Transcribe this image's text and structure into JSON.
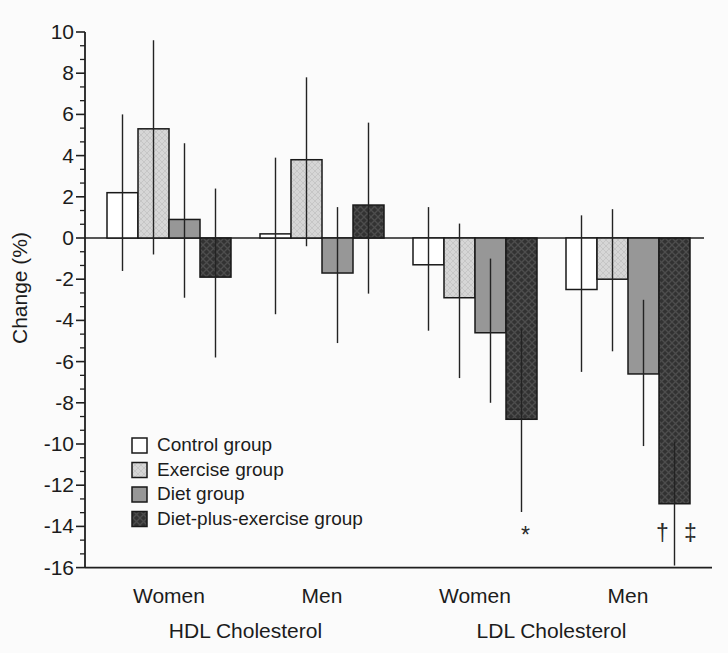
{
  "figure": {
    "background": "#fbfbfb",
    "text_color": "#1c1c1c",
    "axis_color": "#1f1f1f"
  },
  "chart_data": {
    "type": "bar",
    "title": "",
    "xlabel": "",
    "ylabel": "Change (%)",
    "ylim": [
      -16,
      10
    ],
    "ytick_interval": 2,
    "yticks": [
      10,
      8,
      6,
      4,
      2,
      0,
      -2,
      -4,
      -6,
      -8,
      -10,
      -12,
      -14,
      -16
    ],
    "grid": false,
    "legend_position": "lower-left",
    "categories": [
      "Women",
      "Men",
      "Women",
      "Men"
    ],
    "axis_groups": [
      {
        "label": "HDL Cholesterol",
        "category_indexes": [
          0,
          1
        ]
      },
      {
        "label": "LDL Cholesterol",
        "category_indexes": [
          2,
          3
        ]
      }
    ],
    "series": [
      {
        "name": "Control group",
        "fill": "#ffffff",
        "pattern": "none",
        "values": [
          2.2,
          0.2,
          -1.3,
          -2.5
        ],
        "error_low": [
          -1.6,
          -3.7,
          -4.5,
          -6.5
        ],
        "error_high": [
          6.0,
          3.9,
          1.5,
          1.1
        ]
      },
      {
        "name": "Exercise group",
        "fill": "#d6d6d6",
        "pattern": "light-crosshatch",
        "values": [
          5.3,
          3.8,
          -2.9,
          -2.0
        ],
        "error_low": [
          -0.8,
          -0.4,
          -6.8,
          -5.5
        ],
        "error_high": [
          9.6,
          7.8,
          0.7,
          1.4
        ]
      },
      {
        "name": "Diet group",
        "fill": "#979797",
        "pattern": "none",
        "values": [
          0.9,
          -1.7,
          -4.6,
          -6.6
        ],
        "error_low": [
          -2.9,
          -5.1,
          -8.0,
          -10.1
        ],
        "error_high": [
          4.6,
          1.5,
          -1.0,
          -3.0
        ]
      },
      {
        "name": "Diet-plus-exercise group",
        "fill": "#333333",
        "pattern": "dark-crosshatch",
        "values": [
          -1.9,
          1.6,
          -8.8,
          -12.9
        ],
        "error_low": [
          -5.8,
          -2.7,
          -13.3,
          -15.9
        ],
        "error_high": [
          2.4,
          5.6,
          -4.4,
          -9.9
        ]
      }
    ],
    "annotations": [
      {
        "text": "*",
        "category_index": 2,
        "series_index": 3,
        "value_y": -14.4,
        "dx": 4
      },
      {
        "text": "†",
        "category_index": 3,
        "series_index": 3,
        "value_y": -14.3,
        "dx": -12
      },
      {
        "text": "‡",
        "category_index": 3,
        "series_index": 3,
        "value_y": -14.3,
        "dx": 16
      }
    ]
  }
}
